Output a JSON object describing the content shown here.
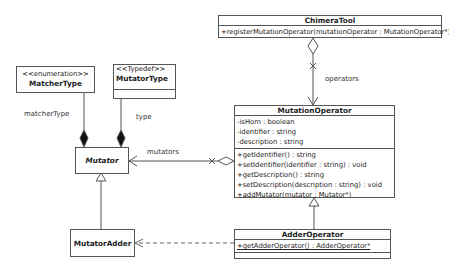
{
  "diagram": {
    "type": "uml-class-diagram",
    "classes": {
      "chimera_tool": {
        "name": "ChimeraTool",
        "operations": [
          "+registerMutationOperator(mutationOperator : MutationOperator*)"
        ]
      },
      "matcher_type": {
        "stereotype": "<<enumeration>>",
        "name": "MatcherType"
      },
      "mutator_type": {
        "stereotype": "<<Typedef>>",
        "name": "MutatorType"
      },
      "mutator": {
        "name": "Mutator",
        "abstract": true
      },
      "mutator_adder": {
        "name": "MutatorAdder"
      },
      "mutation_operator": {
        "name": "MutationOperator",
        "attributes": [
          "-isHom : boolean",
          "-identifier : string",
          "-description : string"
        ],
        "operations": [
          "+getIdentifier() : string",
          "+setIdentifier(identifier : string) : void",
          "+getDescription() : string",
          "+setDescription(description : string) : void",
          "+addMutator(mutator : Mutator*)"
        ]
      },
      "adder_operator": {
        "name": "AdderOperator",
        "operations": [
          "+getAdderOperator() : AdderOperator*"
        ]
      }
    },
    "relationships": {
      "operators_label": "operators",
      "mutators_label": "mutators",
      "matcher_type_label": "matcherType",
      "type_label": "type"
    },
    "colors": {
      "line": "#555555",
      "text": "#222222",
      "background": "#ffffff"
    }
  }
}
